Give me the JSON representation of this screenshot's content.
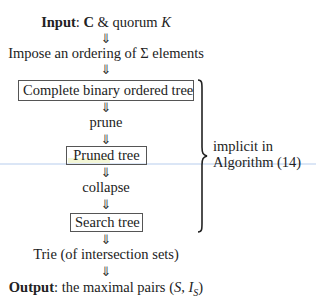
{
  "diagram": {
    "input": {
      "label": "Input",
      "separator": ": ",
      "symbol_c": "C",
      "connector": " & quorum ",
      "symbol_k": "K"
    },
    "arrow_glyph": "⇓",
    "steps": [
      {
        "type": "text",
        "text": "Impose an ordering of Σ elements"
      },
      {
        "type": "box",
        "text": "Complete binary ordered tree"
      },
      {
        "type": "text",
        "text": "prune"
      },
      {
        "type": "box",
        "text": "Pruned tree"
      },
      {
        "type": "text",
        "text": "collapse"
      },
      {
        "type": "box",
        "text": "Search tree"
      },
      {
        "type": "text",
        "text": "Trie (of intersection sets)"
      }
    ],
    "output": {
      "label": "Output",
      "separator": ": ",
      "text": "the maximal pairs ",
      "formula_open": "(",
      "symbol_s": "S",
      "comma": ", ",
      "symbol_i": "I",
      "subscript": "S",
      "formula_close": ")"
    },
    "brace_annotation": {
      "line1": "implicit in",
      "line2": "Algorithm (14)"
    }
  }
}
